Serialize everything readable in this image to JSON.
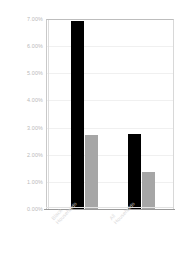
{
  "chart_data": {
    "type": "bar",
    "title": "",
    "subtitle": "",
    "xlabel": "",
    "ylabel": "",
    "categories": [
      "Black Households",
      "All Households"
    ],
    "category_lines": [
      [
        "Black",
        "Households"
      ],
      [
        "All",
        "Households"
      ]
    ],
    "series": [
      {
        "name": "series-1",
        "color": "#000000",
        "values": [
          6.93,
          2.75
        ]
      },
      {
        "name": "series-2",
        "color": "#a6a6a6",
        "values": [
          2.72,
          1.36
        ]
      }
    ],
    "ylim": [
      0,
      7
    ],
    "ytick_values": [
      7,
      6,
      5,
      4,
      3,
      2,
      1,
      0
    ],
    "ytick_labels": [
      "7.00%",
      "6.00%",
      "5.00%",
      "4.00%",
      "3.00%",
      "2.00%",
      "1.00%",
      "0.00%"
    ],
    "grid": true,
    "grid_axis": "y",
    "legend": false,
    "legend_position": "none",
    "tick_label_rotation": -47,
    "annotations": []
  },
  "colors": {
    "background": "#ffffff",
    "series_black": "#000000",
    "series_gray": "#a6a6a6",
    "axis_text": "#b9b9b9",
    "category_text": "#dadada",
    "gridline": "#f0f0f0",
    "frame": "#c9c9c9",
    "baseline": "#9a9a9a"
  }
}
